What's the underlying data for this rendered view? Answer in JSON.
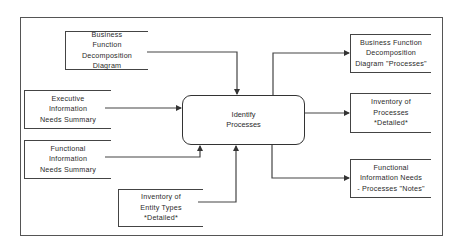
{
  "diagram": {
    "type": "process-flow",
    "process": {
      "label_lines": [
        "Identify",
        "Processes"
      ]
    },
    "inputs": [
      {
        "id": "bfdd",
        "label_lines": [
          "Business",
          "Function",
          "Decomposition",
          "Diagram"
        ]
      },
      {
        "id": "eins",
        "label_lines": [
          "Executive",
          "Information",
          "Needs Summary"
        ]
      },
      {
        "id": "fins",
        "label_lines": [
          "Functional",
          "Information",
          "Needs Summary"
        ]
      },
      {
        "id": "iet",
        "label_lines": [
          "Inventory of",
          "Entity Types",
          "*Detailed*"
        ]
      }
    ],
    "outputs": [
      {
        "id": "bfdd-p",
        "label_lines": [
          "Business Function",
          "Decomposition",
          "Diagram \"Processes\""
        ]
      },
      {
        "id": "ip",
        "label_lines": [
          "Inventory of",
          "Processes",
          "*Detailed*"
        ]
      },
      {
        "id": "finp",
        "label_lines": [
          "Functional",
          "Information Needs",
          "- Processes \"Notes\""
        ]
      }
    ],
    "colors": {
      "line": "#444444",
      "text": "#2a2a2a",
      "background": "#ffffff"
    }
  }
}
